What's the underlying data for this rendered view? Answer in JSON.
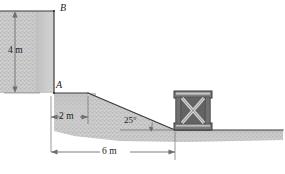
{
  "figure": {
    "points": [
      {
        "id": "B",
        "label": "B",
        "x": 61,
        "y": 10
      },
      {
        "id": "A",
        "label": "A",
        "x": 55,
        "y": 83
      }
    ],
    "dimensions": [
      {
        "id": "height-4m",
        "label": "4 m",
        "value": 4,
        "unit": "m",
        "orientation": "vertical"
      },
      {
        "id": "ledge-2m",
        "label": "2 m",
        "value": 2,
        "unit": "m",
        "orientation": "horizontal"
      },
      {
        "id": "base-6m",
        "label": "6 m",
        "value": 6,
        "unit": "m",
        "orientation": "horizontal"
      }
    ],
    "angles": [
      {
        "id": "slope-angle",
        "label": "25°",
        "value": 25,
        "unit": "deg"
      }
    ],
    "objects": [
      {
        "id": "crate",
        "label": "crate",
        "type": "wooden-crate-x-brace"
      }
    ],
    "colors": {
      "ground_fill": "#c9c9c9",
      "ground_stipple": "#a8a8a8",
      "outline": "#3a3a3a",
      "dimension_line": "#6e6e6e",
      "crate_frame": "#595959",
      "crate_face": "#8f8f8f",
      "crate_brace": "#d2d2d2",
      "text": "#1b1b1b",
      "background": "#ffffff"
    }
  }
}
